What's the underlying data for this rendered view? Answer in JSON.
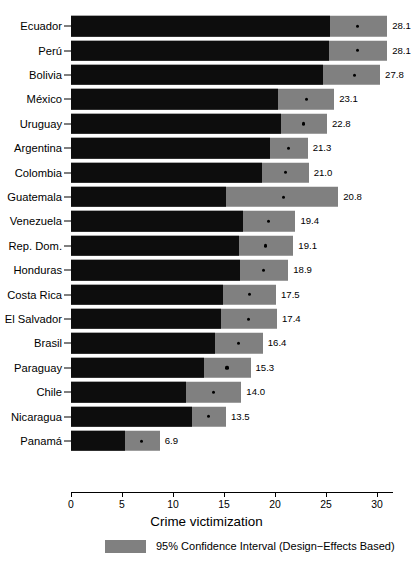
{
  "chart_data": {
    "type": "bar",
    "title": "",
    "xlabel": "Crime victimization",
    "ylabel": "",
    "xlim": [
      0,
      31.6
    ],
    "xticks": [
      0,
      5,
      10,
      15,
      20,
      25,
      30
    ],
    "xtick_labels": [
      "0",
      "5",
      "10",
      "15",
      "20",
      "25",
      "30"
    ],
    "grid": false,
    "orientation": "horizontal",
    "legend_position": "bottom",
    "legend": [
      {
        "label": "95% Confidence Interval (Design−Effects Based)",
        "color": "#808080"
      }
    ],
    "colors": {
      "estimate_bar": "#0d0d0d",
      "confidence_interval": "#808080",
      "point_marker": "#000000",
      "background": "#ffffff",
      "text": "#000000"
    },
    "categories": [
      "Ecuador",
      "Perú",
      "Bolivia",
      "México",
      "Uruguay",
      "Argentina",
      "Colombia",
      "Guatemala",
      "Venezuela",
      "Rep. Dom.",
      "Honduras",
      "Costa Rica",
      "El Salvador",
      "Brasil",
      "Paraguay",
      "Chile",
      "Nicaragua",
      "Panamá"
    ],
    "values": [
      28.1,
      28.1,
      27.8,
      23.1,
      22.8,
      21.3,
      21.0,
      20.8,
      19.4,
      19.1,
      18.9,
      17.5,
      17.4,
      16.4,
      15.3,
      14.0,
      13.5,
      6.9
    ],
    "value_labels": [
      "28.1",
      "28.1",
      "27.8",
      "23.1",
      "22.8",
      "21.3",
      "21.0",
      "20.8",
      "19.4",
      "19.1",
      "18.9",
      "17.5",
      "17.4",
      "16.4",
      "15.3",
      "14.0",
      "13.5",
      "6.9"
    ],
    "ci_lower": [
      25.4,
      25.3,
      24.7,
      20.3,
      20.6,
      19.5,
      18.7,
      15.2,
      16.9,
      16.5,
      16.6,
      14.9,
      14.7,
      14.1,
      13.0,
      11.3,
      11.9,
      5.3
    ],
    "ci_upper": [
      31.0,
      31.0,
      30.3,
      25.8,
      25.1,
      23.2,
      23.3,
      26.2,
      22.0,
      21.8,
      21.3,
      20.1,
      20.2,
      18.8,
      17.6,
      16.7,
      15.2,
      8.7
    ],
    "points": [
      {
        "category": "Ecuador",
        "value": 28.1,
        "label": "28.1",
        "ci_lower": 25.4,
        "ci_upper": 31.0
      },
      {
        "category": "Perú",
        "value": 28.1,
        "label": "28.1",
        "ci_lower": 25.3,
        "ci_upper": 31.0
      },
      {
        "category": "Bolivia",
        "value": 27.8,
        "label": "27.8",
        "ci_lower": 24.7,
        "ci_upper": 30.3
      },
      {
        "category": "México",
        "value": 23.1,
        "label": "23.1",
        "ci_lower": 20.3,
        "ci_upper": 25.8
      },
      {
        "category": "Uruguay",
        "value": 22.8,
        "label": "22.8",
        "ci_lower": 20.6,
        "ci_upper": 25.1
      },
      {
        "category": "Argentina",
        "value": 21.3,
        "label": "21.3",
        "ci_lower": 19.5,
        "ci_upper": 23.2
      },
      {
        "category": "Colombia",
        "value": 21.0,
        "label": "21.0",
        "ci_lower": 18.7,
        "ci_upper": 23.3
      },
      {
        "category": "Guatemala",
        "value": 20.8,
        "label": "20.8",
        "ci_lower": 15.2,
        "ci_upper": 26.2
      },
      {
        "category": "Venezuela",
        "value": 19.4,
        "label": "19.4",
        "ci_lower": 16.9,
        "ci_upper": 22.0
      },
      {
        "category": "Rep. Dom.",
        "value": 19.1,
        "label": "19.1",
        "ci_lower": 16.5,
        "ci_upper": 21.8
      },
      {
        "category": "Honduras",
        "value": 18.9,
        "label": "18.9",
        "ci_lower": 16.6,
        "ci_upper": 21.3
      },
      {
        "category": "Costa Rica",
        "value": 17.5,
        "label": "17.5",
        "ci_lower": 14.9,
        "ci_upper": 20.1
      },
      {
        "category": "El Salvador",
        "value": 17.4,
        "label": "17.4",
        "ci_lower": 14.7,
        "ci_upper": 20.2
      },
      {
        "category": "Brasil",
        "value": 16.4,
        "label": "16.4",
        "ci_lower": 14.1,
        "ci_upper": 18.8
      },
      {
        "category": "Paraguay",
        "value": 15.3,
        "label": "15.3",
        "ci_lower": 13.0,
        "ci_upper": 17.6
      },
      {
        "category": "Chile",
        "value": 14.0,
        "label": "14.0",
        "ci_lower": 11.3,
        "ci_upper": 16.7
      },
      {
        "category": "Nicaragua",
        "value": 13.5,
        "label": "13.5",
        "ci_lower": 11.9,
        "ci_upper": 15.2
      },
      {
        "category": "Panamá",
        "value": 6.9,
        "label": "6.9",
        "ci_lower": 5.3,
        "ci_upper": 8.7
      }
    ]
  }
}
